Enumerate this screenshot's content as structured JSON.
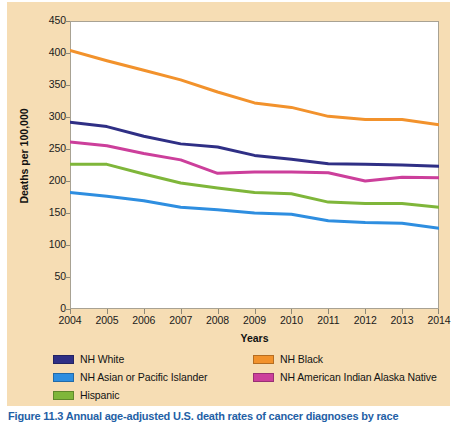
{
  "figure": {
    "background_color": "#f6ddb4",
    "plot_background_color": "#ffffff",
    "caption": "Figure 11.3  Annual age-adjusted U.S. death rates of cancer diagnoses by race"
  },
  "legend": {
    "position": "below-axis",
    "entries": [
      {
        "label": "NH White",
        "color": "#2f2f85"
      },
      {
        "label": "NH Black",
        "color": "#f2922c"
      },
      {
        "label": "NH Asian or Pacific Islander",
        "color": "#2e8ee0"
      },
      {
        "label": "NH American Indian Alaska Native",
        "color": "#cc3f9b"
      },
      {
        "label": "Hispanic",
        "color": "#7fb63a"
      }
    ]
  },
  "chart_data": {
    "type": "line",
    "title": "",
    "xlabel": "Years",
    "ylabel": "Deaths per 100,000",
    "x": [
      2004,
      2005,
      2006,
      2007,
      2008,
      2009,
      2010,
      2011,
      2012,
      2013,
      2014
    ],
    "categories": [
      "2004",
      "2005",
      "2006",
      "2007",
      "2008",
      "2009",
      "2010",
      "2011",
      "2012",
      "2013",
      "2014"
    ],
    "xlim": [
      2004,
      2014
    ],
    "ylim": [
      0,
      450
    ],
    "yticks": [
      0,
      50,
      100,
      150,
      200,
      250,
      300,
      350,
      400,
      450
    ],
    "ytick_labels": [
      "0",
      "50",
      "100",
      "150",
      "200",
      "250",
      "300",
      "350",
      "400",
      "450"
    ],
    "grid": false,
    "series": [
      {
        "name": "NH Black",
        "color": "#f2922c",
        "values": [
          404,
          388,
          373,
          358,
          339,
          322,
          315,
          301,
          296,
          296,
          288
        ]
      },
      {
        "name": "NH White",
        "color": "#2f2f85",
        "values": [
          292,
          285,
          270,
          258,
          253,
          240,
          234,
          227,
          226,
          225,
          223
        ]
      },
      {
        "name": "NH American Indian Alaska Native",
        "color": "#cc3f9b",
        "values": [
          261,
          255,
          243,
          233,
          212,
          214,
          214,
          213,
          200,
          206,
          205
        ]
      },
      {
        "name": "Hispanic",
        "color": "#7fb63a",
        "values": [
          226,
          226,
          211,
          197,
          189,
          182,
          180,
          167,
          165,
          165,
          159
        ]
      },
      {
        "name": "NH Asian or Pacific Islander",
        "color": "#2e8ee0",
        "values": [
          182,
          176,
          169,
          159,
          155,
          150,
          148,
          138,
          135,
          134,
          126
        ]
      }
    ]
  }
}
